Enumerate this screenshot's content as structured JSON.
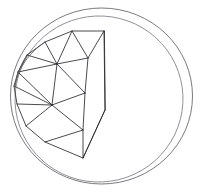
{
  "figure": {
    "caption": "",
    "width": 203,
    "height": 192,
    "background_color": "#ffffff"
  },
  "colors": {
    "sphere_outline": "#6b6b6f",
    "sphere_equator": "#85858a",
    "facet_edge": "#2a2a2e",
    "facet_edge_soft": "#55555a",
    "background": "#ffffff"
  },
  "sphere": {
    "outline_label": "sphere-silhouette-circle",
    "center": {
      "x": 101.5,
      "y": 96
    },
    "radius_x": 91,
    "radius_y": 88,
    "equator_label": "sphere-great-circle-ellipse",
    "equator": {
      "center": {
        "x": 99,
        "y": 99
      },
      "radius_x": 84,
      "radius_y": 83,
      "rotation_deg": -8
    }
  },
  "polyhedron": {
    "label": "triangulated-dome-cap",
    "vertex_count": 16,
    "vertices": [
      {
        "id": "v0",
        "name": "apex-top-right",
        "x": 104,
        "y": 31
      },
      {
        "id": "v1",
        "name": "top-ridge-mid",
        "x": 72,
        "y": 31
      },
      {
        "id": "v2",
        "name": "top-left-upper",
        "x": 45,
        "y": 42
      },
      {
        "id": "v3",
        "name": "left-upper",
        "x": 27,
        "y": 55
      },
      {
        "id": "v4",
        "name": "left-rim-upper",
        "x": 18,
        "y": 72
      },
      {
        "id": "v5",
        "name": "left-rim-mid",
        "x": 14,
        "y": 86
      },
      {
        "id": "v6",
        "name": "left-rim-lower",
        "x": 17,
        "y": 104
      },
      {
        "id": "v7",
        "name": "left-lower",
        "x": 26,
        "y": 126
      },
      {
        "id": "v8",
        "name": "bottom-left",
        "x": 45,
        "y": 142
      },
      {
        "id": "v9",
        "name": "bottom-mid",
        "x": 83,
        "y": 158
      },
      {
        "id": "v10",
        "name": "hub-upper",
        "x": 57,
        "y": 64
      },
      {
        "id": "v11",
        "name": "hub-lower",
        "x": 52,
        "y": 105
      },
      {
        "id": "v12",
        "name": "front-ridge-upper",
        "x": 88,
        "y": 58
      },
      {
        "id": "v13",
        "name": "front-ridge-mid",
        "x": 85,
        "y": 93
      },
      {
        "id": "v14",
        "name": "front-ridge-lower",
        "x": 83,
        "y": 130
      },
      {
        "id": "v15",
        "name": "silhouette-corner",
        "x": 105,
        "y": 110
      }
    ],
    "edges": [
      {
        "from": "v0",
        "to": "v1",
        "style": "hard"
      },
      {
        "from": "v1",
        "to": "v2",
        "style": "hard"
      },
      {
        "from": "v2",
        "to": "v3",
        "style": "hard"
      },
      {
        "from": "v3",
        "to": "v4",
        "style": "hard"
      },
      {
        "from": "v4",
        "to": "v5",
        "style": "hard"
      },
      {
        "from": "v5",
        "to": "v6",
        "style": "hard"
      },
      {
        "from": "v6",
        "to": "v7",
        "style": "hard"
      },
      {
        "from": "v7",
        "to": "v8",
        "style": "hard"
      },
      {
        "from": "v8",
        "to": "v9",
        "style": "hard"
      },
      {
        "from": "v1",
        "to": "v10",
        "style": "hard"
      },
      {
        "from": "v2",
        "to": "v10",
        "style": "hard"
      },
      {
        "from": "v3",
        "to": "v10",
        "style": "hard"
      },
      {
        "from": "v4",
        "to": "v10",
        "style": "hard"
      },
      {
        "from": "v0",
        "to": "v12",
        "style": "hard"
      },
      {
        "from": "v1",
        "to": "v12",
        "style": "hard"
      },
      {
        "from": "v10",
        "to": "v12",
        "style": "hard"
      },
      {
        "from": "v4",
        "to": "v11",
        "style": "hard"
      },
      {
        "from": "v5",
        "to": "v11",
        "style": "hard"
      },
      {
        "from": "v6",
        "to": "v11",
        "style": "hard"
      },
      {
        "from": "v7",
        "to": "v11",
        "style": "hard"
      },
      {
        "from": "v10",
        "to": "v11",
        "style": "hard"
      },
      {
        "from": "v11",
        "to": "v13",
        "style": "hard"
      },
      {
        "from": "v12",
        "to": "v13",
        "style": "hard"
      },
      {
        "from": "v10",
        "to": "v13",
        "style": "hard"
      },
      {
        "from": "v11",
        "to": "v14",
        "style": "hard"
      },
      {
        "from": "v13",
        "to": "v14",
        "style": "hard"
      },
      {
        "from": "v8",
        "to": "v14",
        "style": "hard"
      },
      {
        "from": "v9",
        "to": "v14",
        "style": "hard"
      },
      {
        "from": "v0",
        "to": "v15",
        "style": "hard"
      },
      {
        "from": "v15",
        "to": "v9",
        "style": "hard"
      },
      {
        "from": "v12",
        "to": "v15",
        "style": "soft"
      },
      {
        "from": "v4",
        "to": "v3",
        "style": "soft"
      }
    ],
    "silhouette_path": "M104,31 L72,31 L45,42 L27,55 L18,72 L14,86 L17,104 L26,126 L45,142 L83,158 L105,110 Z"
  }
}
